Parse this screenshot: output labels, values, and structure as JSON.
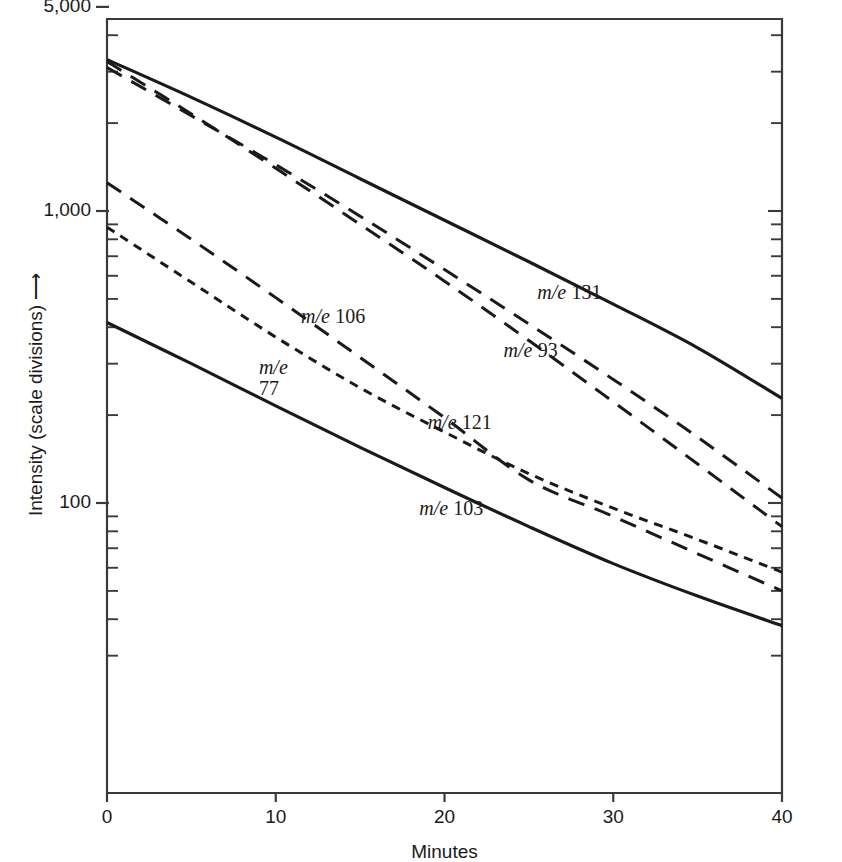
{
  "chart_data": {
    "type": "line",
    "title": "",
    "xlabel": "Minutes",
    "ylabel": "Intensity (scale divisions) ⟶",
    "yscale": "log",
    "xlim": [
      0,
      40
    ],
    "ylim": [
      20,
      5000
    ],
    "grid": false,
    "legend": "inline-labels",
    "x_ticks": [
      {
        "value": 0,
        "label": "0"
      },
      {
        "value": 10,
        "label": "10"
      },
      {
        "value": 20,
        "label": "20"
      },
      {
        "value": 30,
        "label": "30"
      },
      {
        "value": 40,
        "label": "40"
      }
    ],
    "y_ticks_labeled": [
      {
        "value": 5000,
        "label": "5,000"
      },
      {
        "value": 1000,
        "label": "1,000"
      },
      {
        "value": 100,
        "label": "100"
      }
    ],
    "y_minor_ticks": [
      4000,
      3000,
      2000,
      900,
      800,
      700,
      600,
      500,
      400,
      300,
      200,
      90,
      80,
      70,
      60,
      50,
      40,
      30
    ],
    "series": [
      {
        "name": "m/e 131",
        "label_mass": "131",
        "dash": "solid",
        "x": [
          0,
          5,
          10,
          15,
          20,
          25,
          30,
          35,
          40
        ],
        "y": [
          3300,
          2450,
          1790,
          1290,
          930,
          670,
          480,
          340,
          228
        ]
      },
      {
        "name": "m/e 93",
        "label_mass": "93",
        "dash": "long-dash",
        "x": [
          0,
          5,
          10,
          15,
          20,
          25,
          30,
          35,
          40
        ],
        "y": [
          3100,
          2120,
          1440,
          960,
          630,
          410,
          265,
          168,
          104
        ]
      },
      {
        "name": "m/e 121",
        "label_mass": "121",
        "dash": "long-dash",
        "x": [
          0,
          5,
          10,
          15,
          20,
          25,
          30,
          35,
          40
        ],
        "y": [
          3250,
          2150,
          1400,
          900,
          575,
          360,
          222,
          136,
          83
        ]
      },
      {
        "name": "m/e 106",
        "label_mass": "106",
        "dash": "long-dash",
        "x": [
          0,
          5,
          10,
          15,
          20,
          25,
          30,
          35,
          40
        ],
        "y": [
          1250,
          800,
          505,
          315,
          196,
          120,
          90,
          67,
          50
        ]
      },
      {
        "name": "m/e 77",
        "label_mass": "77",
        "dash": "short-dash",
        "x": [
          0,
          5,
          10,
          15,
          20,
          25,
          30,
          35,
          40
        ],
        "y": [
          880,
          570,
          370,
          248,
          175,
          126,
          96,
          75,
          58
        ]
      },
      {
        "name": "m/e 103",
        "label_mass": "103",
        "dash": "solid",
        "x": [
          0,
          5,
          10,
          15,
          20,
          25,
          30,
          35,
          40
        ],
        "y": [
          415,
          300,
          215,
          155,
          113,
          83,
          62,
          48,
          38
        ]
      }
    ],
    "annotations": [
      {
        "text": "m/e 131",
        "x_min": 25.5,
        "y_val": 520
      },
      {
        "text": "m/e 93",
        "x_min": 23.5,
        "y_val": 330
      },
      {
        "text": "m/e 121",
        "x_min": 19.0,
        "y_val": 186
      },
      {
        "text": "m/e 106",
        "x_min": 11.5,
        "y_val": 430
      },
      {
        "text": "m/e 77",
        "x_min": 9.0,
        "y_val": 285
      },
      {
        "text": "m/e 103",
        "x_min": 18.5,
        "y_val": 95
      }
    ]
  },
  "axis": {
    "x_title": "Minutes",
    "y_title": "Intensity (scale divisions)",
    "y_arrow": "⟶",
    "x_tick_labels": [
      "0",
      "10",
      "20",
      "30",
      "40"
    ],
    "y_tick_labels": [
      "5,000",
      "1,000",
      "100"
    ]
  },
  "labels": {
    "me": "m/e",
    "s131": "131",
    "s93": "93",
    "s121": "121",
    "s106": "106",
    "s77": "77",
    "s103": "103"
  },
  "colors": {
    "ink": "#1a1a1a",
    "axis": "#3a3a36",
    "background": "#ffffff"
  }
}
